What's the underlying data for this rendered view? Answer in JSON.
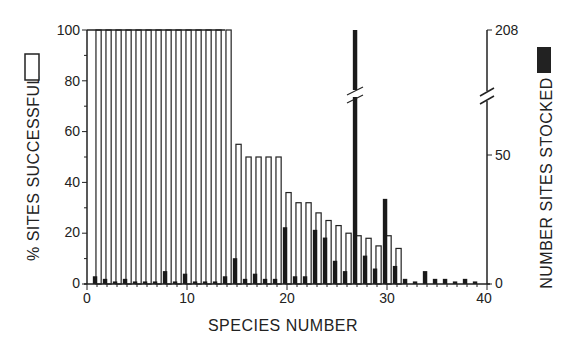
{
  "chart_data": {
    "type": "bar",
    "title": "",
    "xlabel": "SPECIES NUMBER",
    "ylabel": "% SITES SUCCESSFUL",
    "y2label": "NUMBER SITES STOCKED",
    "xlim": [
      0,
      40
    ],
    "ylim": [
      0,
      100
    ],
    "y2lim": [
      0,
      208
    ],
    "y2_break": {
      "lower_max": 70,
      "upper_label": 208
    },
    "x_ticks": [
      0,
      10,
      20,
      30,
      40
    ],
    "y_ticks": [
      0,
      20,
      40,
      60,
      80,
      100
    ],
    "y2_ticks": [
      0,
      50,
      208
    ],
    "grid": false,
    "legend": [
      {
        "name": "% SITES SUCCESSFUL",
        "style": "open (white) bar",
        "axis": "left"
      },
      {
        "name": "NUMBER SITES STOCKED",
        "style": "solid (black) bar",
        "axis": "right"
      }
    ],
    "categories": [
      1,
      2,
      3,
      4,
      5,
      6,
      7,
      8,
      9,
      10,
      11,
      12,
      13,
      14,
      15,
      16,
      17,
      18,
      19,
      20,
      21,
      22,
      23,
      24,
      25,
      26,
      27,
      28,
      29,
      30,
      31,
      32,
      33,
      34,
      35,
      36,
      37,
      38,
      39
    ],
    "series": [
      {
        "name": "% SITES SUCCESSFUL",
        "color": "#ffffff",
        "values": [
          100,
          100,
          100,
          100,
          100,
          100,
          100,
          100,
          100,
          100,
          100,
          100,
          100,
          100,
          55,
          50,
          50,
          50,
          50,
          36,
          32,
          32,
          28,
          25,
          23,
          20,
          19,
          18,
          15,
          19,
          14,
          0,
          0,
          0,
          0,
          0,
          0,
          0,
          0
        ]
      },
      {
        "name": "NUMBER SITES STOCKED",
        "color": "#1a1a1a",
        "values": [
          3,
          2,
          1,
          2,
          1,
          1,
          1,
          5,
          1,
          4,
          1,
          1,
          1,
          3,
          10,
          2,
          4,
          2,
          2,
          22,
          3,
          3,
          21,
          18,
          9,
          5,
          208,
          11,
          6,
          33,
          7,
          2,
          1,
          5,
          2,
          2,
          1,
          2,
          1
        ]
      }
    ]
  },
  "axes": {
    "x_title": "SPECIES NUMBER",
    "y_left_title": "% SITES SUCCESSFUL",
    "y_right_title": "NUMBER SITES STOCKED",
    "x_tick_labels": [
      "0",
      "10",
      "20",
      "30",
      "40"
    ],
    "y_left_tick_labels": [
      "0",
      "20",
      "40",
      "60",
      "80",
      "100"
    ],
    "y_right_tick_labels": [
      "0",
      "50",
      "208"
    ]
  }
}
